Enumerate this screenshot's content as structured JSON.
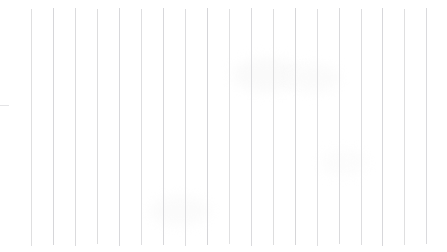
{
  "document": {
    "kind": "scanned-ruled-paper",
    "description": "Blank scanned sheet of vertically ruled paper",
    "width": 447,
    "height": 252,
    "background_color": "#ffffff",
    "has_text": false,
    "has_handwriting": false
  },
  "rules": {
    "orientation": "vertical",
    "count": 19,
    "color": "#d8d8da",
    "line_width_px": 1,
    "first_x": 31,
    "last_x": 426,
    "spacing_px": 21.9,
    "top_y": 8,
    "bottom_y": 245,
    "lines": [
      {
        "x": 31,
        "top": 9,
        "bottom": 246,
        "opacity": 0.85,
        "color": "#d9d9db"
      },
      {
        "x": 53,
        "top": 8,
        "bottom": 245,
        "opacity": 0.95,
        "color": "#d4d4d7"
      },
      {
        "x": 75,
        "top": 8,
        "bottom": 246,
        "opacity": 0.9,
        "color": "#d7d7d9"
      },
      {
        "x": 97,
        "top": 9,
        "bottom": 244,
        "opacity": 0.88,
        "color": "#d8d8da"
      },
      {
        "x": 119,
        "top": 8,
        "bottom": 246,
        "opacity": 0.92,
        "color": "#d5d5d8"
      },
      {
        "x": 141,
        "top": 9,
        "bottom": 245,
        "opacity": 0.86,
        "color": "#d9d9db"
      },
      {
        "x": 163,
        "top": 8,
        "bottom": 245,
        "opacity": 0.93,
        "color": "#d4d4d7"
      },
      {
        "x": 185,
        "top": 9,
        "bottom": 246,
        "opacity": 0.87,
        "color": "#d8d8da"
      },
      {
        "x": 207,
        "top": 8,
        "bottom": 245,
        "opacity": 0.95,
        "color": "#d3d3d6"
      },
      {
        "x": 229,
        "top": 9,
        "bottom": 244,
        "opacity": 0.85,
        "color": "#dadadc"
      },
      {
        "x": 251,
        "top": 8,
        "bottom": 246,
        "opacity": 0.9,
        "color": "#d6d6d9"
      },
      {
        "x": 273,
        "top": 9,
        "bottom": 245,
        "opacity": 0.88,
        "color": "#d8d8da"
      },
      {
        "x": 295,
        "top": 8,
        "bottom": 245,
        "opacity": 0.94,
        "color": "#d3d3d6"
      },
      {
        "x": 317,
        "top": 9,
        "bottom": 246,
        "opacity": 0.86,
        "color": "#d9d9db"
      },
      {
        "x": 339,
        "top": 8,
        "bottom": 244,
        "opacity": 0.91,
        "color": "#d6d6d9"
      },
      {
        "x": 361,
        "top": 9,
        "bottom": 245,
        "opacity": 0.87,
        "color": "#d8d8da"
      },
      {
        "x": 382,
        "top": 8,
        "bottom": 246,
        "opacity": 0.93,
        "color": "#d4d4d7"
      },
      {
        "x": 404,
        "top": 9,
        "bottom": 245,
        "opacity": 0.85,
        "color": "#d9d9db"
      },
      {
        "x": 426,
        "top": 8,
        "bottom": 244,
        "opacity": 0.9,
        "color": "#d6d6d9"
      }
    ]
  },
  "edge_mark": {
    "x": 0,
    "y": 105,
    "width": 9,
    "height": 1,
    "color": "#e4e4e6"
  },
  "smudges": [
    {
      "x": 232,
      "y": 58,
      "w": 70,
      "h": 34,
      "color": "#fafafa"
    },
    {
      "x": 288,
      "y": 64,
      "w": 52,
      "h": 28,
      "color": "#fbfbfb"
    },
    {
      "x": 150,
      "y": 196,
      "w": 60,
      "h": 30,
      "color": "#fbfbfb"
    },
    {
      "x": 320,
      "y": 150,
      "w": 46,
      "h": 26,
      "color": "#fcfcfc"
    }
  ]
}
